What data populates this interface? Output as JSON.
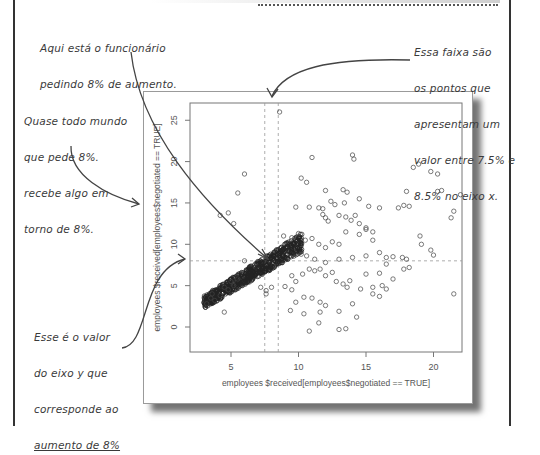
{
  "annotations": {
    "top_left": [
      "Aqui está o funcionário",
      "pedindo 8% de aumento."
    ],
    "left_mid": [
      "Quase todo mundo",
      "que pede 8%.",
      "recebe algo em",
      "torno de 8%."
    ],
    "bottom_left": [
      "Esse é o valor",
      "do eixo y que",
      "corresponde ao",
      "aumento de 8%"
    ],
    "top_right": [
      "Essa faixa são",
      "os pontos que",
      "apresentam um",
      "valor entre 7.5% e",
      "8.5% no eixo x."
    ]
  },
  "chart_data": {
    "type": "scatter",
    "title": "",
    "xlabel": "employees $received[employees$negotiated == TRUE]",
    "ylabel": "employees $received[employees$negotiated == TRUE]",
    "xlim": [
      2.0,
      22.0
    ],
    "ylim": [
      -2.0,
      27.0
    ],
    "xticks": [
      5,
      10,
      15,
      20
    ],
    "yticks": [
      0,
      5,
      10,
      15,
      20,
      25
    ],
    "grid": false,
    "reference_lines": {
      "vertical": [
        7.5,
        8.5
      ],
      "horizontal": [
        8.0
      ],
      "style": "dashed"
    },
    "marker": "open-circle",
    "dense_cluster": {
      "description": "tight diagonal band of points from about (3,3) to (10,10)",
      "x_range": [
        2.8,
        10.5
      ],
      "y_range": [
        2.5,
        11
      ],
      "trend": "y ≈ x"
    },
    "points": [
      [
        3.2,
        2.8
      ],
      [
        3.5,
        3.5
      ],
      [
        3.8,
        3.2
      ],
      [
        3.6,
        4.0
      ],
      [
        4.2,
        3.8
      ],
      [
        4.5,
        4.8
      ],
      [
        4.8,
        4.5
      ],
      [
        5.2,
        5.0
      ],
      [
        5.5,
        5.8
      ],
      [
        5.0,
        5.5
      ],
      [
        4.5,
        1.8
      ],
      [
        7.2,
        4.8
      ],
      [
        7.6,
        4.4
      ],
      [
        8.0,
        4.8
      ],
      [
        7.6,
        4.0
      ],
      [
        6.0,
        8.0
      ],
      [
        9.0,
        4.9
      ],
      [
        4.2,
        13.5
      ],
      [
        4.8,
        13.8
      ],
      [
        5.2,
        12.5
      ],
      [
        5.5,
        16.2
      ],
      [
        6.0,
        18.5
      ],
      [
        8.6,
        26.0
      ],
      [
        11.0,
        20.5
      ],
      [
        10.2,
        18.0
      ],
      [
        10.6,
        17.5
      ],
      [
        14.0,
        20.8
      ],
      [
        14.1,
        20.3
      ],
      [
        12.0,
        16.5
      ],
      [
        13.3,
        16.6
      ],
      [
        13.6,
        16.3
      ],
      [
        9.8,
        14.5
      ],
      [
        10.8,
        14.5
      ],
      [
        11.5,
        14.4
      ],
      [
        11.8,
        14.3
      ],
      [
        12.4,
        15.2
      ],
      [
        12.7,
        14.8
      ],
      [
        13.4,
        15.0
      ],
      [
        14.5,
        15.5
      ],
      [
        15.2,
        14.6
      ],
      [
        16.0,
        14.4
      ],
      [
        11.8,
        13.6
      ],
      [
        12.0,
        13.2
      ],
      [
        12.2,
        12.8
      ],
      [
        13.0,
        13.5
      ],
      [
        13.5,
        13.3
      ],
      [
        13.9,
        12.9
      ],
      [
        14.2,
        13.5
      ],
      [
        14.5,
        12.5
      ],
      [
        15.0,
        12.0
      ],
      [
        15.5,
        11.5
      ],
      [
        18.5,
        19.3
      ],
      [
        18.9,
        19.7
      ],
      [
        19.8,
        18.8
      ],
      [
        20.3,
        18.5
      ],
      [
        18.0,
        16.4
      ],
      [
        20.3,
        16.4
      ],
      [
        20.6,
        16.5
      ],
      [
        17.4,
        14.4
      ],
      [
        17.8,
        14.7
      ],
      [
        18.2,
        14.6
      ],
      [
        22.0,
        16.0
      ],
      [
        21.5,
        14.0
      ],
      [
        21.3,
        13.2
      ],
      [
        19.0,
        11.0
      ],
      [
        19.1,
        10.0
      ],
      [
        19.8,
        9.3
      ],
      [
        8.9,
        11.0
      ],
      [
        9.5,
        10.8
      ],
      [
        10.0,
        11.3
      ],
      [
        10.5,
        10.5
      ],
      [
        11.0,
        10.7
      ],
      [
        11.5,
        10.0
      ],
      [
        12.0,
        9.6
      ],
      [
        12.5,
        10.3
      ],
      [
        13.0,
        10.0
      ],
      [
        13.5,
        11.5
      ],
      [
        14.5,
        11.2
      ],
      [
        15.0,
        11.8
      ],
      [
        15.5,
        10.5
      ],
      [
        16.0,
        9.0
      ],
      [
        16.5,
        8.4
      ],
      [
        17.0,
        8.5
      ],
      [
        17.7,
        8.4
      ],
      [
        17.8,
        7.0
      ],
      [
        18.2,
        7.2
      ],
      [
        18.0,
        8.2
      ],
      [
        20.0,
        8.7
      ],
      [
        9.5,
        6.2
      ],
      [
        9.8,
        5.5
      ],
      [
        10.3,
        6.4
      ],
      [
        10.8,
        7.0
      ],
      [
        11.2,
        6.8
      ],
      [
        11.6,
        7.0
      ],
      [
        12.0,
        6.2
      ],
      [
        12.5,
        6.6
      ],
      [
        12.8,
        5.5
      ],
      [
        13.3,
        5.2
      ],
      [
        13.6,
        4.8
      ],
      [
        13.8,
        5.6
      ],
      [
        9.5,
        4.5
      ],
      [
        10.4,
        3.6
      ],
      [
        9.8,
        3.0
      ],
      [
        11.6,
        3.0
      ],
      [
        9.4,
        2.0
      ],
      [
        10.4,
        1.6
      ],
      [
        11.6,
        1.8
      ],
      [
        11.5,
        0.5
      ],
      [
        10.8,
        -0.5
      ],
      [
        13.5,
        -0.2
      ],
      [
        10.2,
        8.8
      ],
      [
        10.6,
        8.6
      ],
      [
        11.2,
        8.2
      ],
      [
        12.0,
        7.8
      ],
      [
        13.0,
        8.2
      ],
      [
        14.0,
        8.4
      ],
      [
        15.0,
        8.6
      ],
      [
        16.5,
        7.6
      ],
      [
        15.0,
        6.4
      ],
      [
        16.0,
        6.5
      ],
      [
        17.0,
        5.8
      ],
      [
        15.5,
        4.8
      ],
      [
        16.2,
        5.0
      ],
      [
        16.5,
        4.6
      ],
      [
        14.6,
        4.6
      ],
      [
        15.5,
        4.0
      ],
      [
        16.0,
        3.7
      ],
      [
        11.0,
        3.5
      ],
      [
        12.0,
        2.6
      ],
      [
        13.0,
        1.9
      ],
      [
        14.0,
        2.8
      ],
      [
        21.5,
        4.0
      ],
      [
        13.0,
        -0.3
      ],
      [
        14.3,
        1.2
      ]
    ]
  }
}
